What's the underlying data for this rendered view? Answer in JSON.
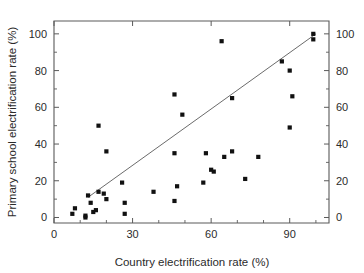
{
  "chart_data": {
    "type": "scatter",
    "title": "",
    "xlabel": "Country electrification rate (%)",
    "ylabel": "Primary school electrification rate (%)",
    "xlim": [
      0,
      105
    ],
    "ylim": [
      -3,
      107
    ],
    "xticks": [
      0,
      30,
      60,
      90
    ],
    "xtick_labels": [
      "0",
      "30",
      "60",
      "90"
    ],
    "xticks_minor": [
      10,
      20,
      40,
      50,
      70,
      80,
      100
    ],
    "yticks": [
      0,
      20,
      40,
      60,
      80,
      100
    ],
    "ytick_labels": [
      "0",
      "20",
      "40",
      "60",
      "80",
      "100"
    ],
    "yticks_minor": [
      10,
      30,
      50,
      70,
      90
    ],
    "right_axis_labels": [
      "0",
      "20",
      "40",
      "60",
      "80",
      "100"
    ],
    "grid": false,
    "legend": null,
    "marker": "square",
    "marker_color": "#111111",
    "fit_line": {
      "label": "",
      "color": "#6b6b6b",
      "x_start": 13,
      "y_start": 11,
      "x_end": 100,
      "y_end": 100
    },
    "points": [
      {
        "x": 7,
        "y": 2
      },
      {
        "x": 8,
        "y": 5
      },
      {
        "x": 12,
        "y": 1
      },
      {
        "x": 12,
        "y": 0
      },
      {
        "x": 13,
        "y": 12
      },
      {
        "x": 14,
        "y": 8
      },
      {
        "x": 15,
        "y": 3
      },
      {
        "x": 16,
        "y": 4
      },
      {
        "x": 17,
        "y": 14
      },
      {
        "x": 17,
        "y": 50
      },
      {
        "x": 19,
        "y": 13
      },
      {
        "x": 20,
        "y": 36
      },
      {
        "x": 20,
        "y": 10
      },
      {
        "x": 26,
        "y": 19
      },
      {
        "x": 27,
        "y": 8
      },
      {
        "x": 27,
        "y": 2
      },
      {
        "x": 38,
        "y": 14
      },
      {
        "x": 46,
        "y": 67
      },
      {
        "x": 46,
        "y": 35
      },
      {
        "x": 46,
        "y": 9
      },
      {
        "x": 47,
        "y": 17
      },
      {
        "x": 49,
        "y": 56
      },
      {
        "x": 57,
        "y": 19
      },
      {
        "x": 58,
        "y": 35
      },
      {
        "x": 60,
        "y": 26
      },
      {
        "x": 61,
        "y": 25
      },
      {
        "x": 64,
        "y": 96
      },
      {
        "x": 65,
        "y": 33
      },
      {
        "x": 68,
        "y": 65
      },
      {
        "x": 68,
        "y": 36
      },
      {
        "x": 73,
        "y": 21
      },
      {
        "x": 78,
        "y": 33
      },
      {
        "x": 87,
        "y": 85
      },
      {
        "x": 90,
        "y": 80
      },
      {
        "x": 90,
        "y": 49
      },
      {
        "x": 91,
        "y": 66
      },
      {
        "x": 99,
        "y": 100
      },
      {
        "x": 99,
        "y": 97
      }
    ]
  }
}
